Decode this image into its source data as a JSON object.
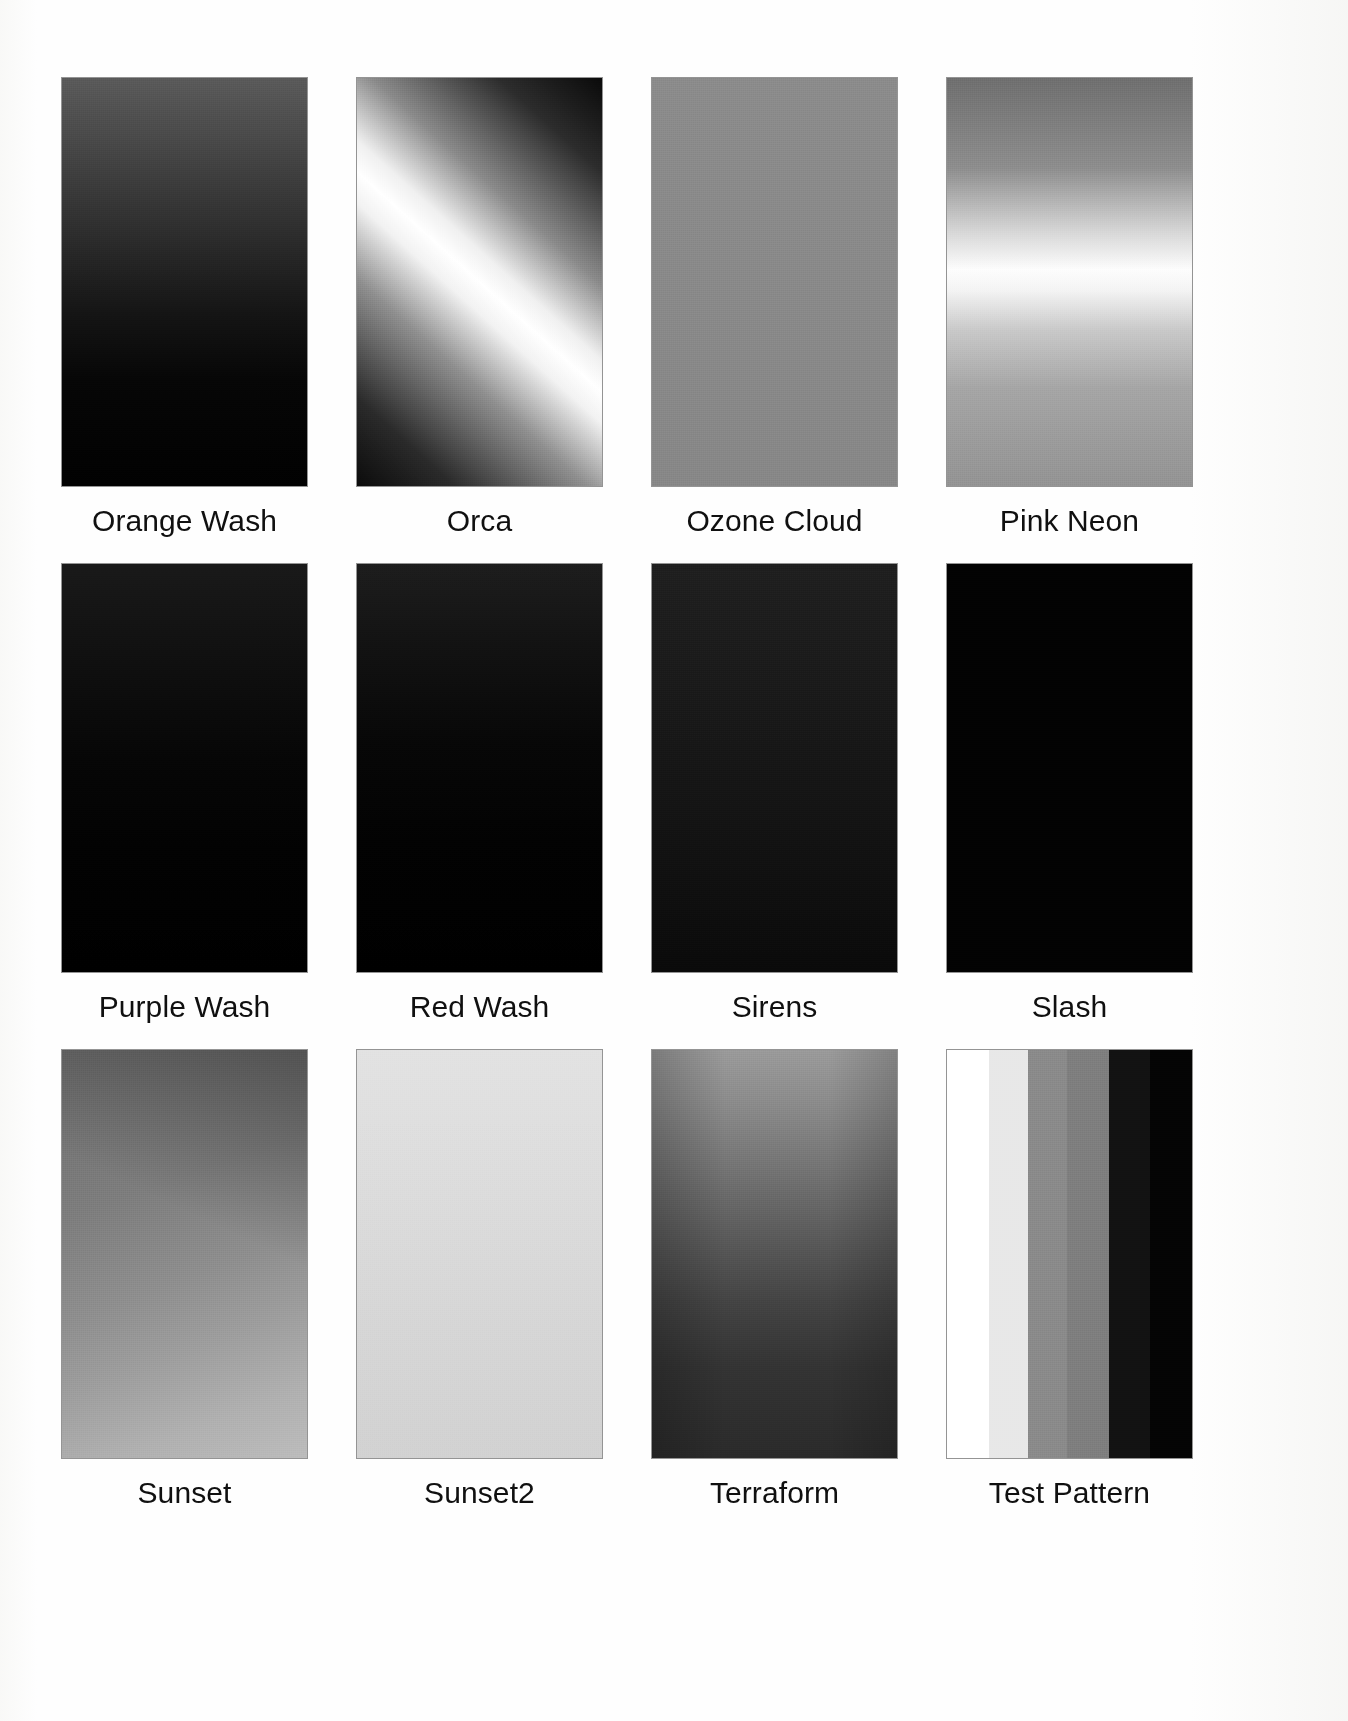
{
  "page": {
    "background": "#ffffff",
    "columns": 4,
    "rows": 3
  },
  "swatches": [
    {
      "name": "Orange Wash",
      "pattern": "linear-vertical",
      "description": "vertical gradient, medium gray at top fading to black at bottom",
      "stops": [
        "#5a5a5a",
        "#2d2d2d",
        "#141414",
        "#010101"
      ]
    },
    {
      "name": "Orca",
      "pattern": "diagonal-band",
      "description": "bright diagonal band running from lower-left to upper-right with dark corners",
      "angle_deg": 42,
      "stops": [
        "#0b0b0b",
        "#8f8f8f",
        "#ffffff",
        "#8a8a8a",
        "#0a0a0a"
      ]
    },
    {
      "name": "Ozone Cloud",
      "pattern": "flat",
      "description": "flat medium gray field",
      "stops": [
        "#8b8b8b",
        "#878787"
      ]
    },
    {
      "name": "Pink Neon",
      "pattern": "linear-vertical-band",
      "description": "horizontal bright band about 45 percent down, gray above and below",
      "stops": [
        "#6f6f6f",
        "#d8d8d8",
        "#fdfdfd",
        "#c8c8c8",
        "#939393"
      ]
    },
    {
      "name": "Purple Wash",
      "pattern": "linear-vertical",
      "description": "near black vertical gradient, very dark gray at top to black",
      "stops": [
        "#191919",
        "#060606",
        "#000000"
      ]
    },
    {
      "name": "Red Wash",
      "pattern": "linear-vertical",
      "description": "near black vertical gradient, very dark gray at top to black",
      "stops": [
        "#1d1d1d",
        "#070707",
        "#000000"
      ]
    },
    {
      "name": "Sirens",
      "pattern": "noise-dark",
      "description": "dark noisy speckled field, slightly lighter at top",
      "stops": [
        "#1f1f1f",
        "#141414",
        "#0a0a0a"
      ]
    },
    {
      "name": "Slash",
      "pattern": "flat",
      "description": "solid black field",
      "stops": [
        "#020202"
      ]
    },
    {
      "name": "Sunset",
      "pattern": "linear-diagonal",
      "description": "medium gray lightening toward the bottom, darker toward the top right",
      "angle_deg": 160,
      "stops": [
        "#6e6e6e",
        "#8e8e8e",
        "#b0b0b0",
        "#bcbcbc"
      ]
    },
    {
      "name": "Sunset2",
      "pattern": "flat-light",
      "description": "very light gray, nearly flat with slight darkening downward",
      "stops": [
        "#e2e2e2",
        "#d6d6d6",
        "#d2d2d2"
      ]
    },
    {
      "name": "Terraform",
      "pattern": "linear-vertical",
      "description": "light gray at top darkening to charcoal at bottom, edges vignetted",
      "stops": [
        "#9a9a9a",
        "#757575",
        "#434343",
        "#2a2a2a"
      ]
    },
    {
      "name": "Test Pattern",
      "pattern": "bars",
      "description": "discrete vertical grayscale bars from white through grays to black",
      "bars": [
        {
          "color": "#ffffff",
          "width_pct": 17
        },
        {
          "color": "#e8e8e8",
          "width_pct": 16
        },
        {
          "color": "#8a8a8a",
          "width_pct": 16
        },
        {
          "color": "#7e7e7e",
          "width_pct": 17
        },
        {
          "color": "#121212",
          "width_pct": 17
        },
        {
          "color": "#040404",
          "width_pct": 17
        }
      ]
    }
  ]
}
